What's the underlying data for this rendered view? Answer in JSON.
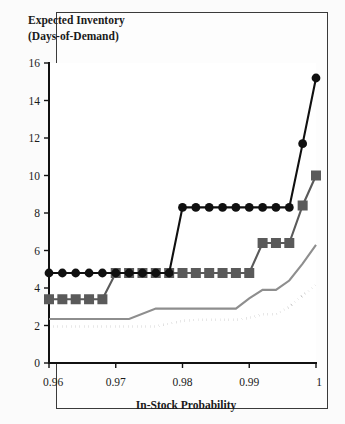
{
  "chart_data": {
    "type": "line",
    "title": "Expected Inventory (Days-of-Demand)",
    "title_line_1": "Expected Inventory",
    "title_line_2": "(Days-of-Demand)",
    "xlabel": "In-Stock Probability",
    "ylabel": "Expected Inventory (Days-of-Demand)",
    "xlim": [
      0.96,
      1.0
    ],
    "ylim": [
      0,
      16
    ],
    "xticks": [
      0.96,
      0.97,
      0.98,
      0.99,
      1.0
    ],
    "xtick_labels": [
      "0.96",
      "0.97",
      "0.98",
      "0.99",
      "1"
    ],
    "yticks": [
      0,
      2,
      4,
      6,
      8,
      10,
      12,
      14,
      16
    ],
    "ytick_labels": [
      "0",
      "2",
      "4",
      "6",
      "8",
      "10",
      "12",
      "14",
      "16"
    ],
    "grid": false,
    "legend": "none",
    "series": [
      {
        "name": "black-circle-series",
        "color": "#101010",
        "marker": "circle",
        "line_style": "solid",
        "line_width": 2.1,
        "marker_size": 4.4,
        "x": [
          0.96,
          0.962,
          0.964,
          0.966,
          0.968,
          0.97,
          0.972,
          0.974,
          0.976,
          0.978,
          0.98,
          0.982,
          0.984,
          0.986,
          0.988,
          0.99,
          0.992,
          0.994,
          0.996,
          0.998,
          1.0
        ],
        "y": [
          4.8,
          4.8,
          4.8,
          4.8,
          4.8,
          4.8,
          4.8,
          4.8,
          4.8,
          4.8,
          8.3,
          8.3,
          8.3,
          8.3,
          8.3,
          8.3,
          8.3,
          8.3,
          8.3,
          11.7,
          15.2
        ]
      },
      {
        "name": "gray-square-series",
        "color": "#5a5a5a",
        "marker": "square",
        "line_style": "solid",
        "line_width": 2.1,
        "marker_size": 5.0,
        "x": [
          0.96,
          0.962,
          0.964,
          0.966,
          0.968,
          0.97,
          0.972,
          0.974,
          0.976,
          0.978,
          0.98,
          0.982,
          0.984,
          0.986,
          0.988,
          0.99,
          0.992,
          0.994,
          0.996,
          0.998,
          1.0
        ],
        "y": [
          3.4,
          3.4,
          3.4,
          3.4,
          3.4,
          4.8,
          4.8,
          4.8,
          4.8,
          4.8,
          4.8,
          4.8,
          4.8,
          4.8,
          4.8,
          4.8,
          6.4,
          6.4,
          6.4,
          8.4,
          10.0
        ]
      },
      {
        "name": "light-gray-line-series",
        "color": "#8e8e8e",
        "marker": "none",
        "line_style": "solid",
        "line_width": 2.1,
        "marker_size": 0,
        "x": [
          0.96,
          0.964,
          0.968,
          0.972,
          0.976,
          0.98,
          0.984,
          0.988,
          0.99,
          0.992,
          0.994,
          0.996,
          0.998,
          1.0
        ],
        "y": [
          2.35,
          2.35,
          2.35,
          2.35,
          2.9,
          2.9,
          2.9,
          2.9,
          3.45,
          3.9,
          3.9,
          4.4,
          5.3,
          6.3
        ]
      },
      {
        "name": "black-dotted-series",
        "color": "#0d0d0d",
        "marker": "none",
        "line_style": "dotted",
        "line_width": 2.6,
        "marker_size": 0,
        "x": [
          0.96,
          0.966,
          0.972,
          0.976,
          0.98,
          0.982,
          0.986,
          0.988,
          0.99,
          0.992,
          0.994,
          0.996,
          0.998,
          1.0
        ],
        "y": [
          1.95,
          1.95,
          1.95,
          1.95,
          2.25,
          2.3,
          2.3,
          2.3,
          2.4,
          2.6,
          2.6,
          3.0,
          3.6,
          4.15
        ]
      }
    ]
  },
  "layout": {
    "plot_left": 49,
    "plot_right": 316,
    "plot_top": 63,
    "plot_bottom": 363,
    "title_x": 28,
    "title_y1": 24,
    "title_y2": 40,
    "xlabel_x": 186,
    "xlabel_y": 409,
    "xtick_label_y": 386
  },
  "colors": {
    "axis": "#111111",
    "frame": "#3a3a3a",
    "page_background": "#fbfbfb",
    "plot_background": "#ffffff",
    "text": "#1a1a1a"
  }
}
